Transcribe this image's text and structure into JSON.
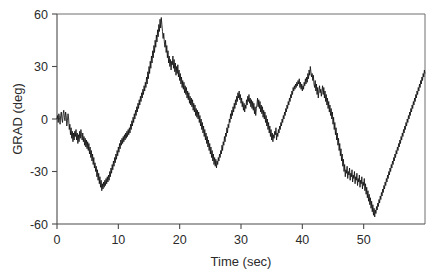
{
  "figure": {
    "background_color": "#ffffff",
    "line_color": "#111111",
    "axis_color": "#4a4a4a"
  },
  "chart_data": {
    "type": "line",
    "title": "",
    "subtitle": "",
    "xlabel": "Time (sec)",
    "ylabel": "GRAD (deg)",
    "xlim": [
      0,
      60
    ],
    "ylim": [
      -60,
      60
    ],
    "xticks": [
      0,
      10,
      20,
      30,
      40,
      50
    ],
    "xtick_labels": [
      "0",
      "10",
      "20",
      "30",
      "40",
      "50"
    ],
    "yticks": [
      -60,
      -30,
      0,
      30,
      60
    ],
    "ytick_labels": [
      "-60",
      "-30",
      "0",
      "30",
      "60"
    ],
    "grid": false,
    "legend": null,
    "legend_position": "none",
    "annotations": [],
    "series": [
      {
        "name": "GRAD",
        "color": "#111111",
        "sample_interval_sec": 0.1,
        "x_start": 0,
        "values": [
          0,
          2,
          -2,
          3,
          1,
          -3,
          2,
          4,
          0,
          -2,
          3,
          5,
          1,
          -1,
          4,
          2,
          -4,
          -1,
          3,
          0,
          -6,
          -3,
          -9,
          -5,
          -11,
          -7,
          -13,
          -8,
          -12,
          -7,
          -10,
          -6,
          -12,
          -8,
          -14,
          -9,
          -13,
          -7,
          -11,
          -6,
          -9,
          -12,
          -8,
          -13,
          -10,
          -15,
          -11,
          -16,
          -12,
          -17,
          -13,
          -18,
          -14,
          -20,
          -16,
          -22,
          -18,
          -24,
          -20,
          -26,
          -22,
          -28,
          -25,
          -30,
          -27,
          -33,
          -29,
          -35,
          -31,
          -37,
          -33,
          -39,
          -35,
          -41,
          -37,
          -40,
          -36,
          -39,
          -35,
          -38,
          -34,
          -37,
          -33,
          -36,
          -32,
          -35,
          -30,
          -33,
          -28,
          -31,
          -26,
          -29,
          -24,
          -27,
          -22,
          -25,
          -20,
          -23,
          -18,
          -21,
          -16,
          -19,
          -14,
          -17,
          -12,
          -15,
          -11,
          -14,
          -10,
          -13,
          -9,
          -12,
          -8,
          -11,
          -7,
          -10,
          -6,
          -9,
          -5,
          -8,
          -3,
          -6,
          -1,
          -4,
          1,
          -2,
          3,
          0,
          5,
          2,
          7,
          4,
          9,
          6,
          11,
          8,
          13,
          10,
          15,
          12,
          17,
          14,
          19,
          16,
          21,
          18,
          24,
          20,
          27,
          23,
          30,
          26,
          33,
          29,
          36,
          32,
          39,
          35,
          42,
          38,
          45,
          41,
          48,
          44,
          51,
          47,
          54,
          50,
          57,
          52,
          58,
          54,
          50,
          46,
          49,
          44,
          41,
          45,
          38,
          42,
          35,
          39,
          32,
          36,
          30,
          34,
          28,
          33,
          31,
          36,
          29,
          34,
          27,
          32,
          25,
          30,
          26,
          31,
          24,
          28,
          22,
          26,
          20,
          24,
          18,
          22,
          17,
          21,
          15,
          19,
          14,
          18,
          12,
          16,
          11,
          15,
          9,
          13,
          8,
          12,
          7,
          11,
          5,
          9,
          4,
          8,
          2,
          6,
          1,
          5,
          0,
          4,
          -2,
          2,
          -4,
          0,
          -6,
          -2,
          -8,
          -4,
          -10,
          -6,
          -12,
          -8,
          -14,
          -10,
          -16,
          -12,
          -18,
          -14,
          -20,
          -16,
          -22,
          -18,
          -24,
          -20,
          -26,
          -22,
          -27,
          -23,
          -28,
          -24,
          -26,
          -22,
          -24,
          -20,
          -22,
          -18,
          -20,
          -15,
          -18,
          -13,
          -15,
          -10,
          -13,
          -8,
          -10,
          -5,
          -8,
          -3,
          -5,
          0,
          -2,
          3,
          0,
          5,
          2,
          7,
          4,
          9,
          6,
          11,
          8,
          13,
          10,
          15,
          12,
          16,
          11,
          14,
          9,
          12,
          7,
          10,
          5,
          9,
          4,
          8,
          6,
          11,
          8,
          13,
          10,
          14,
          9,
          12,
          7,
          11,
          6,
          10,
          5,
          9,
          3,
          7,
          2,
          6,
          8,
          12,
          7,
          11,
          6,
          10,
          4,
          8,
          3,
          7,
          1,
          5,
          0,
          4,
          -2,
          2,
          -4,
          0,
          -6,
          -2,
          -8,
          -4,
          -10,
          -6,
          -12,
          -8,
          -13,
          -9,
          -11,
          -7,
          -9,
          -5,
          -12,
          -8,
          -10,
          -6,
          -8,
          -4,
          -6,
          -2,
          -4,
          0,
          -2,
          2,
          0,
          4,
          2,
          6,
          4,
          8,
          6,
          10,
          8,
          12,
          10,
          14,
          12,
          16,
          14,
          18,
          16,
          19,
          17,
          20,
          18,
          21,
          19,
          22,
          20,
          23,
          18,
          21,
          17,
          20,
          16,
          19,
          17,
          21,
          19,
          23,
          20,
          24,
          21,
          26,
          23,
          28,
          25,
          30,
          27,
          24,
          26,
          22,
          25,
          20,
          18,
          22,
          16,
          20,
          14,
          18,
          12,
          16,
          19,
          15,
          17,
          13,
          16,
          19,
          14,
          18,
          12,
          16,
          10,
          14,
          8,
          12,
          6,
          10,
          4,
          8,
          2,
          6,
          0,
          4,
          -3,
          1,
          -6,
          -2,
          -9,
          -5,
          -12,
          -8,
          -15,
          -11,
          -18,
          -14,
          -21,
          -17,
          -24,
          -20,
          -27,
          -23,
          -30,
          -26,
          -33,
          -29,
          -31,
          -27,
          -34,
          -30,
          -32,
          -28,
          -35,
          -31,
          -33,
          -29,
          -36,
          -32,
          -34,
          -30,
          -37,
          -33,
          -35,
          -31,
          -38,
          -34,
          -36,
          -32,
          -39,
          -35,
          -37,
          -33,
          -40,
          -36,
          -38,
          -34,
          -41,
          -37,
          -43,
          -39,
          -45,
          -41,
          -47,
          -43,
          -49,
          -45,
          -51,
          -47,
          -53,
          -49,
          -55,
          -51,
          -56,
          -52,
          -54,
          -50,
          -52,
          -48,
          -50,
          -46,
          -48,
          -44,
          -46,
          -42,
          -44,
          -40,
          -42,
          -38,
          -40,
          -36,
          -38,
          -34,
          -36,
          -32,
          -34,
          -30,
          -32,
          -28,
          -30,
          -26,
          -28,
          -24,
          -26,
          -22,
          -24,
          -20,
          -22,
          -18,
          -20,
          -16,
          -18,
          -14,
          -16,
          -12,
          -14,
          -10,
          -12,
          -8,
          -10,
          -6,
          -8,
          -4,
          -6,
          -2,
          -4,
          0,
          -2,
          2,
          0,
          4,
          2,
          6,
          4,
          8,
          6,
          10,
          8,
          12,
          10,
          14,
          12,
          16,
          14,
          18,
          16,
          20,
          18,
          22,
          20,
          24,
          22,
          26,
          24,
          28,
          26,
          31,
          28,
          33,
          30,
          36,
          32,
          35,
          31,
          34,
          30,
          33,
          31,
          36,
          33,
          37,
          32,
          35,
          31,
          34,
          29,
          32,
          27,
          30,
          25,
          28,
          23,
          26,
          21,
          24,
          19,
          22,
          17,
          20,
          15,
          18,
          13,
          16,
          11,
          14,
          9,
          12,
          7,
          10,
          5,
          8,
          3,
          6,
          1,
          4,
          -1,
          2,
          -3,
          0,
          -5,
          -2,
          -7,
          -4,
          -9,
          -6,
          -11,
          -8,
          -13,
          -10,
          -15,
          -12,
          -16,
          -13,
          -14,
          -11,
          -12,
          -9,
          -14,
          -11,
          -12,
          -9,
          -10,
          -7,
          -12,
          -9,
          -10,
          -7,
          -8,
          -5,
          -6,
          -3,
          -4,
          -1,
          -2,
          1,
          0,
          3,
          2,
          5,
          4,
          7,
          6,
          9,
          8,
          11,
          10,
          13,
          12,
          15,
          14,
          17,
          16,
          19,
          18,
          21,
          20,
          23,
          22,
          25,
          24,
          27,
          26,
          29,
          25,
          28,
          24,
          27,
          23,
          26,
          25,
          29,
          27,
          31,
          29,
          33,
          31,
          35,
          33,
          37,
          35,
          39,
          37,
          40,
          36,
          38,
          34,
          37,
          33,
          36,
          32,
          35,
          30,
          33,
          28,
          31,
          26,
          29,
          27,
          31,
          25,
          29,
          23,
          27,
          21,
          25,
          19,
          23,
          17,
          21,
          19,
          24,
          22,
          27,
          25,
          30,
          27,
          32,
          29,
          33,
          30,
          27,
          29,
          25,
          27,
          23,
          25,
          21,
          23,
          19,
          21,
          17,
          19,
          15,
          17,
          13,
          15,
          11,
          13,
          9,
          11,
          7,
          9,
          5,
          7,
          3,
          5,
          1,
          3,
          -1,
          1,
          -3,
          -1,
          -5,
          -3,
          -7,
          -5,
          -9,
          -7,
          -11,
          -9,
          -13,
          -11,
          -15,
          -13,
          -14,
          -11,
          -13,
          -9,
          -11,
          -7,
          -9,
          -5,
          -8,
          -4,
          -7,
          -3,
          -6,
          -2,
          -5,
          -1,
          -4,
          0,
          -3,
          1,
          -2,
          2,
          -1,
          3,
          0,
          4,
          1,
          5,
          2,
          6,
          3,
          7,
          4,
          8,
          5,
          9,
          6,
          10,
          7,
          11,
          8,
          12,
          9,
          13,
          10,
          14,
          11,
          12,
          9,
          11,
          8,
          10,
          7,
          9,
          6,
          8,
          5,
          7,
          4,
          6,
          3,
          5,
          2,
          4,
          1,
          3,
          0,
          2,
          -1,
          1,
          -2,
          0,
          -3,
          -1,
          -4,
          -2,
          -5,
          -3,
          -6,
          -4,
          -7,
          -5,
          -8,
          -6,
          -9,
          -7,
          -10,
          -8,
          -11,
          -9,
          -12,
          -10,
          -13,
          -11,
          -12,
          -9,
          -11,
          -8,
          -10,
          -7,
          -9,
          -6,
          -8,
          -5,
          -7,
          -4,
          -6,
          -3,
          -5,
          -2,
          -4,
          -1,
          -3,
          0,
          -2,
          1,
          -1,
          2,
          0,
          3,
          1,
          4,
          2,
          6,
          3,
          8,
          5,
          10,
          7,
          12,
          9,
          14,
          11,
          16,
          13,
          18,
          15,
          20,
          17,
          22,
          19,
          24,
          21,
          26,
          23,
          28,
          25,
          30,
          27,
          32,
          29,
          34,
          31,
          36,
          33,
          38,
          35,
          40,
          37,
          42,
          39,
          44,
          41,
          46,
          43,
          48,
          45,
          50,
          47,
          49,
          46,
          48,
          45,
          47,
          44,
          46,
          43,
          45,
          42,
          44,
          41,
          43,
          40,
          42,
          39,
          41,
          38,
          40,
          37,
          39,
          36,
          38,
          35,
          37,
          34,
          36,
          33,
          35,
          32,
          34,
          31,
          33,
          30,
          32,
          29,
          31,
          28,
          30,
          27,
          29,
          26,
          28,
          25,
          27,
          24,
          26,
          23,
          25,
          22,
          24,
          21,
          23,
          20,
          22,
          18,
          20,
          16,
          18,
          14,
          16,
          12,
          14,
          10,
          12,
          8,
          10,
          6,
          8,
          4,
          6,
          2,
          4,
          0,
          2,
          -2,
          0,
          -4,
          -2,
          -6,
          -4,
          -8,
          -6,
          -10,
          -8,
          -12,
          -10,
          -14,
          -12,
          -16,
          -14,
          -18,
          -16,
          -20,
          -18,
          -22,
          -20,
          -24,
          -22,
          -26,
          -24,
          -28,
          -26,
          -30,
          -28,
          -32,
          -30,
          -34,
          -32,
          -36,
          -34,
          -38,
          -36,
          -40,
          -38,
          -42,
          -40,
          -44,
          -42,
          -46,
          -44,
          -48,
          -46,
          -50,
          -48,
          -49,
          -46,
          -48,
          -45,
          -47,
          -44,
          -46,
          -43,
          -45,
          -42,
          -44,
          -41,
          -43,
          -40,
          -42,
          -38,
          -40,
          -36,
          -38,
          -34,
          -36,
          -32,
          -34,
          -30,
          -32,
          -28,
          -30,
          -26,
          -28,
          -24,
          -26,
          -22,
          -24,
          -20,
          -22,
          -18,
          -20,
          -16,
          -18,
          -14,
          -16,
          -12,
          -14,
          -10,
          -12,
          -8,
          -10,
          -6,
          -8,
          -4,
          -6,
          -2,
          -4,
          0,
          -2,
          2,
          0,
          4,
          2,
          6,
          4,
          8,
          6,
          10,
          8,
          12,
          10,
          14,
          12,
          16,
          14,
          18,
          16,
          20,
          18,
          22,
          19,
          21,
          17,
          19,
          15,
          17,
          13,
          15,
          11,
          13,
          9,
          11,
          7,
          9,
          5,
          7,
          3,
          5,
          1,
          3,
          -1,
          1,
          -3,
          0,
          -4,
          -1,
          -5,
          -2,
          -6,
          -3,
          -7,
          -4,
          -8,
          -5,
          -9,
          -6,
          -8,
          -4,
          -6,
          -2,
          -4
        ]
      }
    ]
  }
}
